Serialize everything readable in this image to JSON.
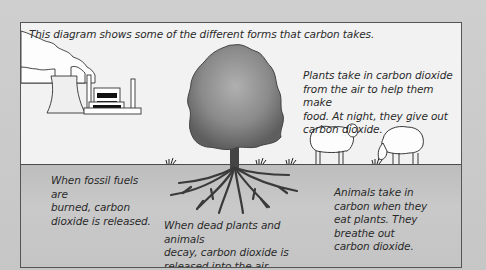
{
  "diagram": {
    "intro": "This diagram shows some of the different forms that carbon takes.",
    "labels": {
      "plants": [
        "Plants take in carbon dioxide",
        "from the air to help them make",
        "food. At night, they give out",
        "carbon dioxide."
      ],
      "fossil_fuels": [
        "When fossil fuels are",
        "burned, carbon",
        "dioxide is released."
      ],
      "decay": [
        "When dead plants and animals",
        "decay, carbon dioxide is",
        "released into the air."
      ],
      "animals": [
        "Animals take in",
        "carbon when they",
        "eat plants. They",
        "breathe out",
        "carbon dioxide."
      ]
    },
    "illustrations": [
      "power-station",
      "tree-with-roots",
      "sheep-standing",
      "sheep-grazing",
      "grass-tufts"
    ],
    "colors": {
      "background": "#c9c9c9",
      "sky": "#f2f2f2",
      "ground": "#c4c4c4",
      "tree_canopy": "#808080",
      "outline": "#333333"
    }
  }
}
